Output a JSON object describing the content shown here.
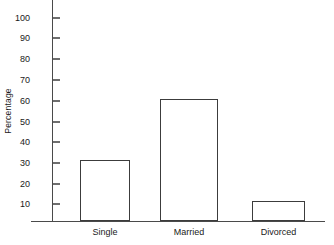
{
  "chart_data": {
    "type": "bar",
    "title": "",
    "xlabel": "",
    "ylabel": "Percentage",
    "categories": [
      "Single",
      "Married",
      "Divorced"
    ],
    "values": [
      30,
      60,
      10
    ],
    "ylim": [
      0,
      100
    ],
    "yticks": [
      10,
      20,
      30,
      40,
      50,
      60,
      70,
      80,
      90,
      100
    ],
    "ytick_labels": [
      "10",
      "20",
      "30",
      "40",
      "50",
      "60",
      "70",
      "80",
      "90",
      "100"
    ],
    "grid": false,
    "legend": false,
    "bar_fill": "none",
    "bar_outline_color": "#3c3c3c",
    "axis_color": "#4a4a4a",
    "background_color": "#ffffff"
  },
  "axis": {
    "y_title": "Percentage"
  },
  "bars": [
    {
      "label": "Single",
      "value": 30,
      "left": 80,
      "width": 50
    },
    {
      "label": "Married",
      "value": 60,
      "left": 160,
      "width": 58
    },
    {
      "label": "Divorced",
      "value": 10,
      "left": 252,
      "width": 53
    }
  ],
  "ticks": [
    {
      "label": "100",
      "value": 100,
      "top": 18
    },
    {
      "label": "90",
      "value": 90,
      "top": 38
    },
    {
      "label": "80",
      "value": 80,
      "top": 59
    },
    {
      "label": "70",
      "value": 70,
      "top": 80
    },
    {
      "label": "60",
      "value": 60,
      "top": 101
    },
    {
      "label": "50",
      "value": 50,
      "top": 122
    },
    {
      "label": "40",
      "value": 40,
      "top": 142
    },
    {
      "label": "30",
      "value": 30,
      "top": 163
    },
    {
      "label": "20",
      "value": 20,
      "top": 184
    },
    {
      "label": "10",
      "value": 10,
      "top": 204
    }
  ]
}
